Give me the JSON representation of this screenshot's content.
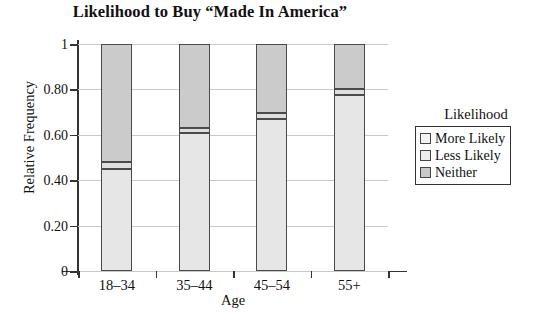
{
  "chart_data": {
    "type": "bar",
    "subtype": "stacked-100-percent",
    "title": "Likelihood to Buy “Made In America”",
    "xlabel": "Age",
    "ylabel": "Relative Frequency",
    "categories": [
      "18–34",
      "35–44",
      "45–54",
      "55+"
    ],
    "ylim": [
      0,
      1
    ],
    "yticks": [
      0,
      0.2,
      0.4,
      0.6,
      0.8,
      1
    ],
    "ytick_labels": [
      "0",
      "0.20",
      "0.40",
      "0.60",
      "0.80",
      "1"
    ],
    "grid": true,
    "legend_position": "right",
    "legend_title": "Likelihood",
    "stack_order_bottom_to_top": [
      "More Likely",
      "Less Likely",
      "Neither"
    ],
    "series": [
      {
        "name": "More Likely",
        "color": "#e6e6e6",
        "values": [
          0.45,
          0.61,
          0.67,
          0.775
        ]
      },
      {
        "name": "Less Likely",
        "color": "#dedede",
        "values": [
          0.03,
          0.02,
          0.025,
          0.025
        ]
      },
      {
        "name": "Neither",
        "color": "#cbcbcb",
        "values": [
          0.52,
          0.37,
          0.305,
          0.2
        ]
      }
    ],
    "cumulative_tops": {
      "More Likely": [
        0.45,
        0.61,
        0.67,
        0.775
      ],
      "Less Likely": [
        0.48,
        0.63,
        0.695,
        0.8
      ],
      "Neither": [
        1,
        1,
        1,
        1
      ]
    }
  },
  "legend": {
    "title": "Likelihood",
    "items": [
      {
        "label": "More Likely",
        "swatch": "swatch-more-likely"
      },
      {
        "label": "Less Likely",
        "swatch": "swatch-less-likely"
      },
      {
        "label": "Neither",
        "swatch": "swatch-neither"
      }
    ]
  },
  "axes": {
    "y_title": "Relative Frequency",
    "x_title": "Age",
    "y_ticks": [
      "1",
      "0.80",
      "0.60",
      "0.40",
      "0.20",
      "0"
    ],
    "x_ticks": [
      "18–34",
      "35–44",
      "45–54",
      "55+"
    ]
  },
  "title": "Likelihood to Buy “Made In America”",
  "colors": {
    "more_likely": "#e6e6e6",
    "less_likely": "#dedede",
    "neither": "#cbcbcb",
    "axis": "#333333",
    "grid": "#c9c9c9",
    "bar_outline": "#4a4a4a"
  }
}
